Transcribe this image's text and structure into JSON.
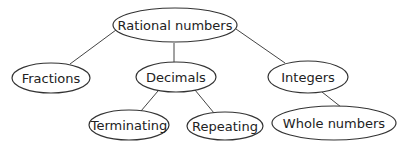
{
  "diagram": {
    "nodes": [
      {
        "id": "rational",
        "label": "Rational numbers"
      },
      {
        "id": "fractions",
        "label": "Fractions"
      },
      {
        "id": "decimals",
        "label": "Decimals"
      },
      {
        "id": "integers",
        "label": "Integers"
      },
      {
        "id": "terminating",
        "label": "Terminating"
      },
      {
        "id": "repeating",
        "label": "Repeating"
      },
      {
        "id": "whole",
        "label": "Whole numbers"
      }
    ],
    "edges": [
      {
        "from": "rational",
        "to": "fractions"
      },
      {
        "from": "rational",
        "to": "decimals"
      },
      {
        "from": "rational",
        "to": "integers"
      },
      {
        "from": "decimals",
        "to": "terminating"
      },
      {
        "from": "decimals",
        "to": "repeating"
      },
      {
        "from": "integers",
        "to": "whole"
      }
    ]
  }
}
